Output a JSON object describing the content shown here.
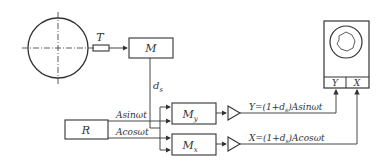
{
  "diagram": {
    "workpiece": {
      "label": ""
    },
    "sensor": {
      "label": "T"
    },
    "modulator_main": {
      "label": "M"
    },
    "signal_ds": {
      "label": "d",
      "sub": "s"
    },
    "reference": {
      "label": "R"
    },
    "ref_sin": {
      "label": "Asinωt"
    },
    "ref_cos": {
      "label": "Acosωt"
    },
    "mult_y": {
      "label": "M",
      "sub": "y"
    },
    "mult_x": {
      "label": "M",
      "sub": "x"
    },
    "out_y": {
      "label": "Y=(1+d",
      "sub": "s",
      "tail": ")Asinωt"
    },
    "out_x": {
      "label": "X=(1+d",
      "sub": "s",
      "tail": ")Acosωt"
    },
    "display": {
      "y_input": "Y",
      "x_input": "X"
    }
  }
}
